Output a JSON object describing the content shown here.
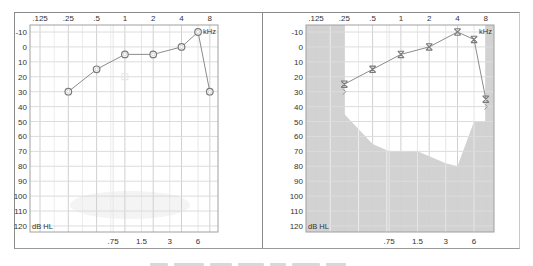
{
  "chart_data": [
    {
      "type": "line",
      "title": "Right ear audiogram",
      "xlabel": "kHz",
      "ylabel": "dB HL",
      "x_ticks_top": [
        ".125",
        ".25",
        ".5",
        "1",
        "2",
        "4",
        "8"
      ],
      "x_ticks_bottom": [
        ".75",
        "1.5",
        "3",
        "6"
      ],
      "y_ticks": [
        "-10",
        "0",
        "10",
        "20",
        "30",
        "40",
        "50",
        "60",
        "70",
        "80",
        "90",
        "100",
        "110",
        "120"
      ],
      "ylim": [
        -10,
        120
      ],
      "y_inverted": true,
      "grid": true,
      "marker": "circle",
      "series": [
        {
          "name": "Air conduction (O)",
          "x": [
            0.25,
            0.5,
            1,
            2,
            4,
            6,
            8
          ],
          "values": [
            30,
            15,
            5,
            5,
            0,
            -10,
            30
          ]
        }
      ],
      "annotations": [
        {
          "symbol": "small-square",
          "x": 1,
          "y": 20
        }
      ],
      "shaded_region": "none"
    },
    {
      "type": "line",
      "title": "Left ear audiogram",
      "xlabel": "kHz",
      "ylabel": "dB HL",
      "x_ticks_top": [
        ".125",
        ".25",
        ".5",
        "1",
        "2",
        "4",
        "8"
      ],
      "x_ticks_bottom": [
        ".75",
        "1.5",
        "3",
        "6"
      ],
      "y_ticks": [
        "-10",
        "0",
        "10",
        "20",
        "30",
        "40",
        "50",
        "60",
        "70",
        "80",
        "90",
        "100",
        "110",
        "120"
      ],
      "ylim": [
        -10,
        120
      ],
      "y_inverted": true,
      "grid": true,
      "marker": "x",
      "series": [
        {
          "name": "Air conduction (X)",
          "x": [
            0.25,
            0.5,
            1,
            2,
            4,
            6,
            8
          ],
          "values": [
            25,
            15,
            5,
            0,
            -10,
            -5,
            35
          ]
        }
      ],
      "bone_conduction_marks": [
        {
          "x": 0.25,
          "y": 30
        },
        {
          "x": 8,
          "y": 40
        }
      ],
      "shaded_region_boundary": {
        "description": "gray shading outside white audible area",
        "x": [
          0.25,
          0.5,
          0.75,
          1,
          1.5,
          3,
          4,
          6,
          8
        ],
        "values": [
          45,
          65,
          70,
          70,
          70,
          78,
          80,
          50,
          50
        ]
      }
    }
  ],
  "panels": {
    "left": {
      "unit_label": "kHz",
      "db_label": "dB HL",
      "x_top": [
        ".125",
        ".25",
        ".5",
        "1",
        "2",
        "4",
        "8"
      ],
      "x_bottom": [
        ".75",
        "1.5",
        "3",
        "6"
      ],
      "y": [
        "-10",
        "0",
        "10",
        "20",
        "30",
        "40",
        "50",
        "60",
        "70",
        "80",
        "90",
        "100",
        "110",
        "120"
      ]
    },
    "right": {
      "unit_label": "kHz",
      "db_label": "dB HL",
      "x_top": [
        ".125",
        ".25",
        ".5",
        "1",
        "2",
        "4",
        "8"
      ],
      "x_bottom": [
        ".75",
        "1.5",
        "3",
        "6"
      ],
      "y": [
        "-10",
        "0",
        "10",
        "20",
        "30",
        "40",
        "50",
        "60",
        "70",
        "80",
        "90",
        "100",
        "110",
        "120"
      ]
    }
  },
  "colors": {
    "grid": "#dcdcdc",
    "axis_frame": "#a0a0a0",
    "line": "#8c8c8c",
    "marker": "#7a7a7a",
    "shade": "#d2d2d2",
    "text": "#333333"
  }
}
